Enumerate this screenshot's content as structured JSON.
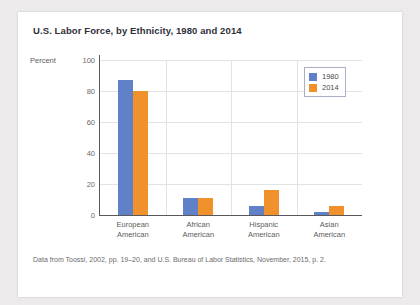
{
  "chart_data": {
    "type": "bar",
    "title": "U.S. Labor Force, by Ethnicity, 1980 and 2014",
    "xlabel": "",
    "ylabel": "Percent",
    "ylim": [
      0,
      100
    ],
    "yticks": [
      0,
      20,
      40,
      60,
      80,
      100
    ],
    "grid": true,
    "legend_position": "top-right",
    "categories": [
      "European\nAmerican",
      "African\nAmerican",
      "Hispanic\nAmerican",
      "Asian\nAmerican"
    ],
    "category_lines": [
      [
        "European",
        "American"
      ],
      [
        "African",
        "American"
      ],
      [
        "Hispanic",
        "American"
      ],
      [
        "Asian",
        "American"
      ]
    ],
    "series": [
      {
        "name": "1980",
        "color": "#6080c8",
        "values": [
          87,
          11,
          6,
          2
        ]
      },
      {
        "name": "2014",
        "color": "#f0912c",
        "values": [
          80,
          11,
          16,
          6
        ]
      }
    ],
    "source_note": "Data from Toossi, 2002, pp. 19–20, and U.S. Bureau of Labor Statistics, November, 2015, p. 2."
  },
  "legend": {
    "items": [
      {
        "label": "1980",
        "color": "#6080c8"
      },
      {
        "label": "2014",
        "color": "#f0912c"
      }
    ]
  },
  "ytick_labels": [
    "100",
    "80",
    "60",
    "40",
    "20",
    "0"
  ]
}
